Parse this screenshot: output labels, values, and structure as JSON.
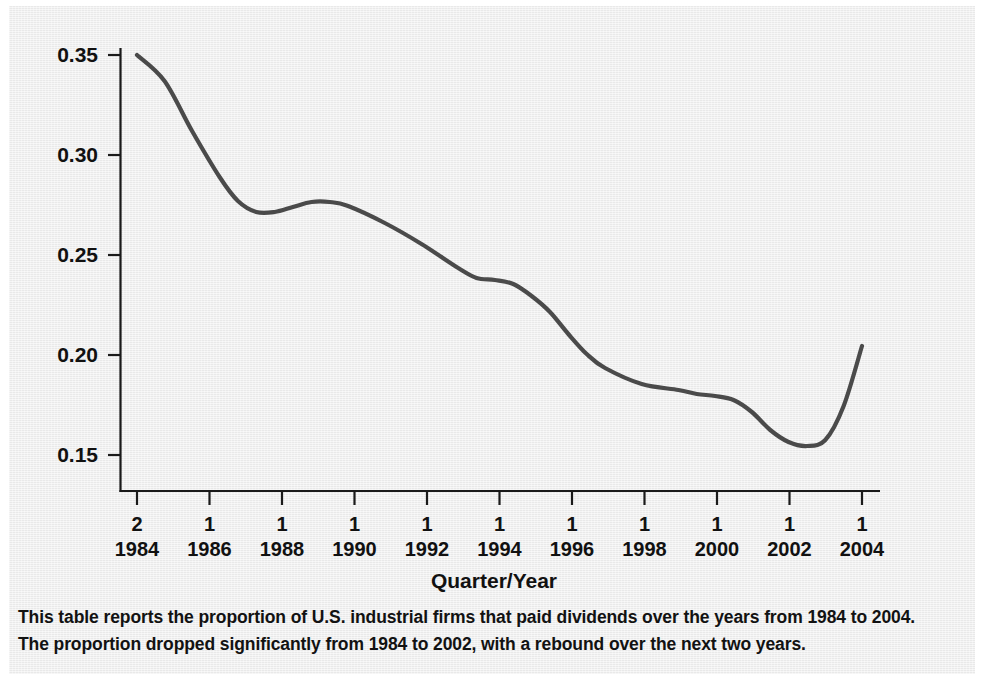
{
  "chart_data": {
    "type": "line",
    "title": "",
    "xlabel": "Quarter/Year",
    "ylabel": "",
    "xlim": [
      1984.25,
      2004.0
    ],
    "ylim": [
      0.15,
      0.35
    ],
    "grid": false,
    "legend": null,
    "y_ticks": [
      "0.35",
      "0.30",
      "0.25",
      "0.20",
      "0.15"
    ],
    "y_tick_values": [
      0.35,
      0.3,
      0.25,
      0.2,
      0.15
    ],
    "x_ticks": [
      {
        "quarter": "2",
        "year": "1984"
      },
      {
        "quarter": "1",
        "year": "1986"
      },
      {
        "quarter": "1",
        "year": "1988"
      },
      {
        "quarter": "1",
        "year": "1990"
      },
      {
        "quarter": "1",
        "year": "1992"
      },
      {
        "quarter": "1",
        "year": "1994"
      },
      {
        "quarter": "1",
        "year": "1996"
      },
      {
        "quarter": "1",
        "year": "1998"
      },
      {
        "quarter": "1",
        "year": "2000"
      },
      {
        "quarter": "1",
        "year": "2002"
      },
      {
        "quarter": "1",
        "year": "2004"
      }
    ],
    "series": [
      {
        "name": "Proportion of U.S. industrial firms paying dividends",
        "color": "#4a4a4a",
        "x": [
          1984.25,
          1985.0,
          1985.75,
          1986.5,
          1987.0,
          1987.5,
          1988.0,
          1988.5,
          1989.0,
          1989.5,
          1990.0,
          1991.0,
          1992.0,
          1993.0,
          1993.5,
          1994.0,
          1994.5,
          1995.0,
          1995.5,
          1996.0,
          1996.5,
          1997.0,
          1998.0,
          1999.0,
          1999.5,
          2000.0,
          2000.5,
          2001.0,
          2001.5,
          2002.0,
          2002.5,
          2003.0,
          2003.5,
          2004.0
        ],
        "values": [
          0.35,
          0.337,
          0.312,
          0.289,
          0.277,
          0.2715,
          0.2715,
          0.274,
          0.2765,
          0.2765,
          0.2745,
          0.266,
          0.2555,
          0.2435,
          0.2385,
          0.2375,
          0.2355,
          0.2295,
          0.2215,
          0.2105,
          0.2005,
          0.1935,
          0.1855,
          0.1825,
          0.1805,
          0.1795,
          0.1775,
          0.1715,
          0.1625,
          0.1565,
          0.1545,
          0.1575,
          0.1745,
          0.2045
        ]
      }
    ]
  },
  "axis": {
    "x_title": "Quarter/Year"
  },
  "caption": {
    "line1": "This table reports the proportion of U.S. industrial firms that paid dividends over the years from 1984 to 2004.",
    "line2": "The proportion dropped significantly from 1984 to 2002, with a rebound over the next two years."
  },
  "colors": {
    "line": "#4a4a4a",
    "axis": "#1a1a1a",
    "background": "#e9e9e9",
    "text": "#111111"
  }
}
